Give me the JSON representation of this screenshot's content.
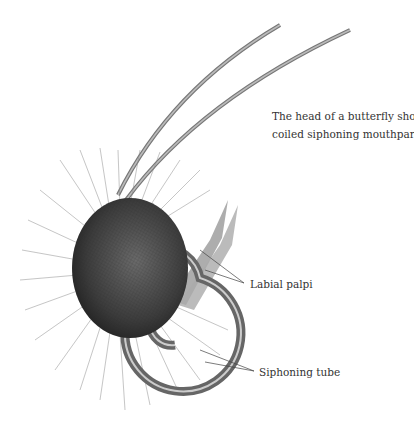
{
  "figure": {
    "caption_line1": "The head of a butterfly showing the",
    "caption_line2": "coiled siphoning mouthparts",
    "labels": {
      "palpi": "Labial palpi",
      "tube": "Siphoning tube"
    },
    "colors": {
      "line_art": "#555555",
      "eye_dark": "#3a3a3a",
      "text": "#333333"
    }
  }
}
